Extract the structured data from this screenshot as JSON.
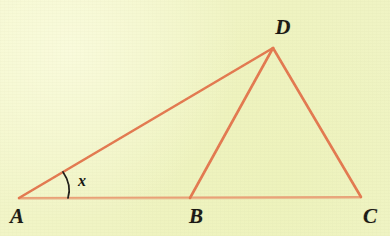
{
  "figure": {
    "kind": "geometry-diagram",
    "background_color": "#f1f5c6",
    "stroke_color": "#e3784f",
    "base_stroke_color": "#eaa077",
    "label_color": "#191713",
    "arc_color": "#1c1a16",
    "canvas": {
      "width": 390,
      "height": 236
    },
    "points": {
      "A": {
        "x": 19,
        "y": 198
      },
      "B": {
        "x": 190,
        "y": 198
      },
      "C": {
        "x": 361,
        "y": 197
      },
      "D": {
        "x": 273,
        "y": 48
      }
    },
    "segments": [
      {
        "name": "segment-AC",
        "from": "A",
        "to": "C",
        "width": 1.9,
        "color": "#eaa077"
      },
      {
        "name": "segment-AD",
        "from": "A",
        "to": "D",
        "width": 2.6,
        "color": "#e3784f"
      },
      {
        "name": "segment-BD",
        "from": "B",
        "to": "D",
        "width": 2.6,
        "color": "#e3784f"
      },
      {
        "name": "segment-DC",
        "from": "D",
        "to": "C",
        "width": 2.6,
        "color": "#e3784f"
      }
    ],
    "labels": {
      "A": {
        "text": "A",
        "x": 17,
        "y": 216
      },
      "B": {
        "text": "B",
        "x": 196,
        "y": 216
      },
      "C": {
        "text": "C",
        "x": 370,
        "y": 216
      },
      "D": {
        "text": "D",
        "x": 283,
        "y": 27
      }
    },
    "angle_mark": {
      "text": "x",
      "at_vertex": "A",
      "label_x": 82,
      "label_y": 181,
      "arc_start": {
        "x": 63,
        "y": 172
      },
      "arc_end": {
        "x": 68,
        "y": 198
      },
      "arc_control": {
        "x": 72,
        "y": 185
      }
    }
  }
}
